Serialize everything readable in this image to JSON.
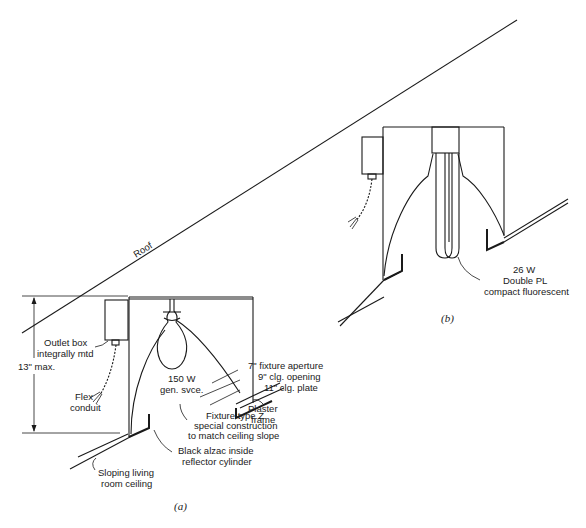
{
  "diagram": {
    "roof_label": "Roof",
    "figure_a": {
      "caption": "(a)",
      "labels": {
        "outlet_box_1": "Outlet box",
        "outlet_box_2": "integrally mtd",
        "height_dim": "13\" max.",
        "flex_1": "Flex",
        "flex_2": "conduit",
        "lamp_1": "150 W",
        "lamp_2": "gen. svce.",
        "aperture": "7\" fixture aperture",
        "clg_opening": "9\" clg. opening",
        "clg_plate": "11\" clg. plate",
        "plaster_1": "Plaster",
        "plaster_2": "frame",
        "fixture_1": "Fixture type Z",
        "fixture_2": "special construction",
        "fixture_3": "to match ceiling slope",
        "alzac_1": "Black alzac inside",
        "alzac_2": "reflector cylinder",
        "ceiling_1": "Sloping living",
        "ceiling_2": "room ceiling"
      }
    },
    "figure_b": {
      "caption": "(b)",
      "labels": {
        "lamp_1": "26 W",
        "lamp_2": "Double PL",
        "lamp_3": "compact fluorescent"
      }
    }
  }
}
